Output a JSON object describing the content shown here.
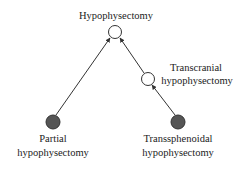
{
  "diagram": {
    "type": "directed-graph",
    "colors": {
      "edge": "#333333",
      "open_node_fill": "#ffffff",
      "filled_node_fill": "#555555",
      "node_stroke": "#333333",
      "text": "#222222"
    },
    "nodes": [
      {
        "id": "hypophysectomy",
        "label_lines": [
          "Hypophysectomy"
        ],
        "style": "open",
        "cx": 115,
        "cy": 32
      },
      {
        "id": "transcranial",
        "label_lines": [
          "Transcranial",
          "hypophysectomy"
        ],
        "style": "open",
        "cx": 148,
        "cy": 79
      },
      {
        "id": "partial",
        "label_lines": [
          "Partial",
          "hypophysectomy"
        ],
        "style": "filled",
        "cx": 53,
        "cy": 122
      },
      {
        "id": "transsphenoidal",
        "label_lines": [
          "Transsphenoidal",
          "hypophysectomy"
        ],
        "style": "filled",
        "cx": 178,
        "cy": 122
      }
    ],
    "edges": [
      {
        "from": "partial",
        "to": "hypophysectomy"
      },
      {
        "from": "transcranial",
        "to": "hypophysectomy"
      },
      {
        "from": "transsphenoidal",
        "to": "transcranial"
      }
    ]
  }
}
